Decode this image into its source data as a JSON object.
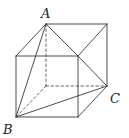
{
  "diagram": {
    "type": "cube-with-tetrahedron",
    "labels": {
      "A": "A",
      "B": "B",
      "C": "C"
    },
    "vertices": {
      "A": [
        46,
        24
      ],
      "back_top_right": [
        107,
        24
      ],
      "C": [
        107,
        86
      ],
      "back_bottom_left_hidden": [
        46,
        86
      ],
      "front_top_left": [
        16,
        56
      ],
      "front_top_right": [
        78,
        56
      ],
      "front_bottom_right": [
        78,
        117
      ],
      "B": [
        16,
        117
      ]
    },
    "stroke_color": "#3a3a3a"
  }
}
